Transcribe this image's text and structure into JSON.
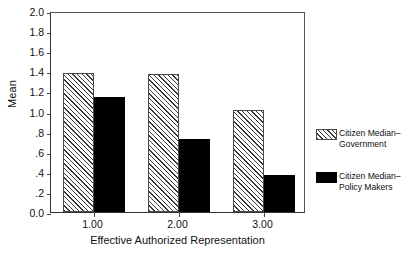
{
  "chart_data": {
    "type": "bar",
    "title": "",
    "xlabel": "Effective Authorized Representation",
    "ylabel": "Mean",
    "categories": [
      "1.00",
      "2.00",
      "3.00"
    ],
    "series": [
      {
        "name": "Citizen Median–Government",
        "name_line1": "Citizen Median–",
        "name_line2": "Government",
        "fill": "hatched",
        "color": "#3a3a3a",
        "values": [
          1.38,
          1.37,
          1.02
        ]
      },
      {
        "name": "Citizen Median–Policy Makers",
        "name_line1": "Citizen Median–",
        "name_line2": "Policy Makers",
        "fill": "solid",
        "color": "#000000",
        "values": [
          1.14,
          0.73,
          0.37
        ]
      }
    ],
    "ylim": [
      0.0,
      2.0
    ],
    "ytick_values": [
      0.0,
      0.2,
      0.4,
      0.6,
      0.8,
      1.0,
      1.2,
      1.4,
      1.6,
      1.8,
      2.0
    ],
    "ytick_labels": [
      "0.0",
      ".2",
      ".4",
      ".6",
      ".8",
      "1.0",
      "1.2",
      "1.4",
      "1.6",
      "1.8",
      "2.0"
    ],
    "grid": false,
    "legend_position": "right"
  }
}
